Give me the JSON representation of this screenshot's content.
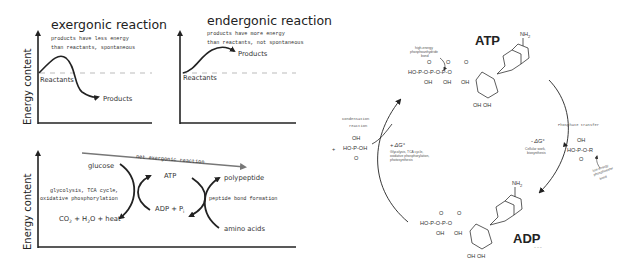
{
  "exergonic": {
    "title": "exergonic reaction",
    "desc_line1": "products have less energy",
    "desc_line2": "than reactants, spontaneous",
    "y_axis": "Energy content",
    "reactants": "Reactants",
    "products": "Products"
  },
  "endergonic": {
    "title": "endergonic reaction",
    "desc_line1": "products have more energy",
    "desc_line2": "than reactants, not spontaneous",
    "reactants": "Reactants",
    "products": "Products"
  },
  "coupled": {
    "y_axis": "Energy content",
    "net_label": "net exergonic reaction",
    "glucose": "glucose",
    "process1_line1": "glycolysis, TCA cycle,",
    "process1_line2": "oxidative phosphorylation",
    "co2": "CO",
    "co2_sub": "2",
    "plus_h2o": " + H",
    "h2o_sub": "2",
    "o_heat": "O + heat",
    "atp": "ATP",
    "adp": "ADP + P",
    "pi_sub": "i",
    "polypeptide": "polypeptide",
    "process2": "peptide bond formation",
    "amino_acids": "amino acids"
  },
  "cycle": {
    "atp_label": "ATP",
    "adp_label": "ADP",
    "nh2": "NH",
    "nh2_sub": "2",
    "high_energy_bond_line1": "high-energy",
    "high_energy_bond_line2": "phosphoanhydride",
    "high_energy_bond_line3": "bond",
    "condensation_line1": "Condensation",
    "condensation_line2": "reaction",
    "plus_sign": "+",
    "plus_dg": "+ ΔG°",
    "plus_dg_desc1": "Glycolysis, TCA cycle,",
    "plus_dg_desc2": "oxidative phosphorylation,",
    "plus_dg_desc3": "photosynthesis",
    "phosphate_transfer": "Phosphate transfer",
    "minus_dg": "- ΔG°",
    "minus_dg_desc1": "Cellular work,",
    "minus_dg_desc2": "biosynthesis",
    "low_energy_line1": "low-energy",
    "low_energy_line2": "phosphoester",
    "low_energy_line3": "bond",
    "r_group": "R",
    "ho": "HO",
    "oh": "OH",
    "o": "O",
    "p": "P",
    "n": "N",
    "credit": "~ ~ ~"
  }
}
